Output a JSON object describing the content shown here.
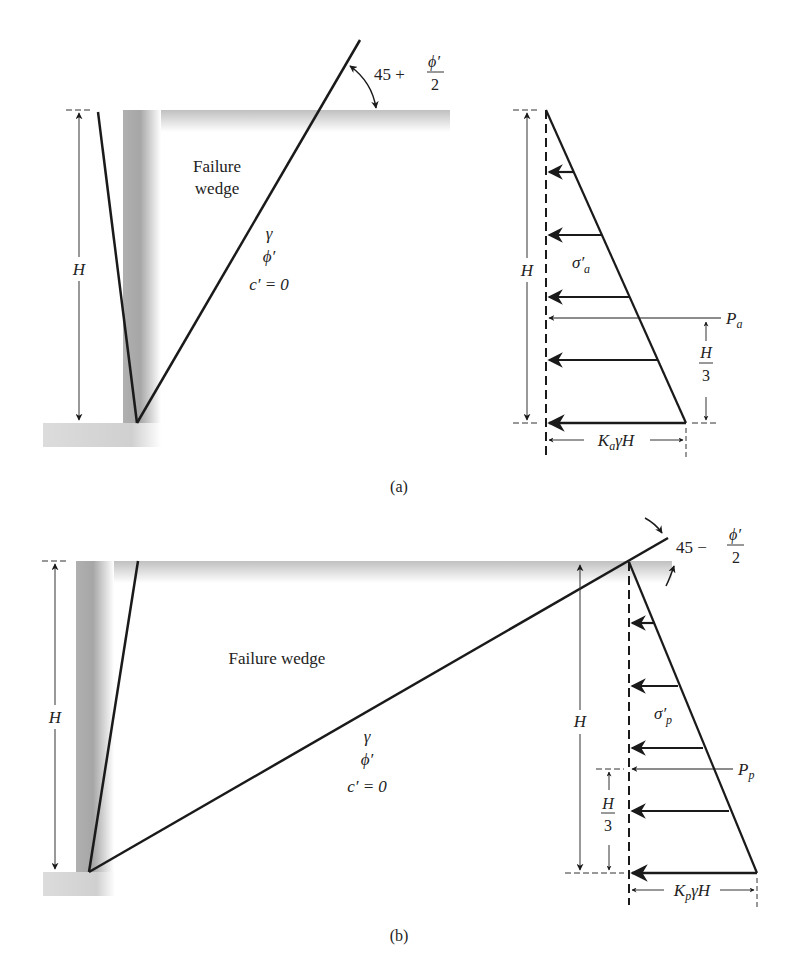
{
  "figure": {
    "panel_a": {
      "caption": "(a)",
      "title": "Rankine active pressure",
      "wedge_label_line1": "Failure",
      "wedge_label_line2": "wedge",
      "height_label": "H",
      "soil_gamma": "γ",
      "soil_phi": "ϕ′",
      "soil_c": "c′ = 0",
      "angle_prefix": "45 +",
      "angle_num": "ϕ′",
      "angle_den": "2",
      "pressure_label": "σ′",
      "pressure_sub": "a",
      "force_label": "P",
      "force_sub": "a",
      "lever_num": "H",
      "lever_den": "3",
      "base_K": "K",
      "base_sub": "a",
      "base_rest": "γH"
    },
    "panel_b": {
      "caption": "(b)",
      "title": "Rankine passive pressure",
      "wedge_label": "Failure wedge",
      "height_label": "H",
      "soil_gamma": "γ",
      "soil_phi": "ϕ′",
      "soil_c": "c′ = 0",
      "angle_prefix": "45 −",
      "angle_num": "ϕ′",
      "angle_den": "2",
      "pressure_label": "σ′",
      "pressure_sub": "p",
      "force_label": "P",
      "force_sub": "p",
      "lever_num": "H",
      "lever_den": "3",
      "right_height_label": "H",
      "base_K": "K",
      "base_sub": "p",
      "base_rest": "γH"
    },
    "colors": {
      "line": "#1a1a1a",
      "shade_dark": "#a8a8a8",
      "shade_light": "#f2f2f2",
      "text": "#222222"
    }
  }
}
